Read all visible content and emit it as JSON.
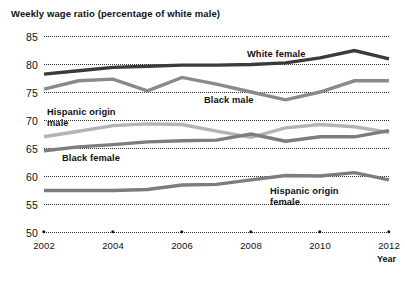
{
  "chart_data": {
    "type": "line",
    "title": "Weekly wage ratio (percentage of white male)",
    "xlabel": "Year",
    "ylabel": "",
    "ylim": [
      50,
      85
    ],
    "yticks": [
      50,
      55,
      60,
      65,
      70,
      75,
      80,
      85
    ],
    "xlim": [
      2002,
      2012
    ],
    "xticks": [
      2002,
      2004,
      2006,
      2008,
      2010,
      2012
    ],
    "xticklabels": [
      "2002",
      "2004",
      "2006",
      "2008",
      "2010",
      "2012"
    ],
    "grid": "horizontal-dotted",
    "legend": "inline-labels",
    "x": [
      2002,
      2003,
      2004,
      2005,
      2006,
      2007,
      2008,
      2009,
      2010,
      2011,
      2012
    ],
    "series": [
      {
        "name": "White female",
        "color": "#3b3b3b",
        "label": "White female",
        "label_x": 247,
        "label_y": 49,
        "values": [
          78.2,
          78.8,
          79.4,
          79.6,
          79.8,
          79.8,
          79.9,
          80.2,
          81.1,
          82.4,
          80.9
        ]
      },
      {
        "name": "Black male",
        "color": "#8a8a8a",
        "label": "Black male",
        "label_x": 204,
        "label_y": 95,
        "values": [
          75.5,
          77.0,
          77.3,
          75.2,
          77.6,
          76.4,
          75.0,
          73.6,
          75.0,
          77.0,
          77.0
        ]
      },
      {
        "name": "Hispanic origin male",
        "color": "#b4b4b4",
        "label": "Hispanic origin\nmale",
        "label_x": 47,
        "label_y": 107,
        "values": [
          67.0,
          68.0,
          69.0,
          69.3,
          69.2,
          68.0,
          66.9,
          68.6,
          69.2,
          68.8,
          67.8
        ]
      },
      {
        "name": "Black female",
        "color": "#7d7d7d",
        "label": "Black female",
        "label_x": 62,
        "label_y": 153,
        "values": [
          64.5,
          65.2,
          65.6,
          66.1,
          66.3,
          66.4,
          67.5,
          66.2,
          67.0,
          67.0,
          68.1
        ]
      },
      {
        "name": "Hispanic origin female",
        "color": "#7d7d7d",
        "label": "Hispanic origin\nfemale",
        "label_x": 270,
        "label_y": 186,
        "values": [
          57.4,
          57.4,
          57.4,
          57.6,
          58.4,
          58.5,
          59.3,
          60.1,
          60.0,
          60.6,
          59.3
        ]
      }
    ]
  }
}
